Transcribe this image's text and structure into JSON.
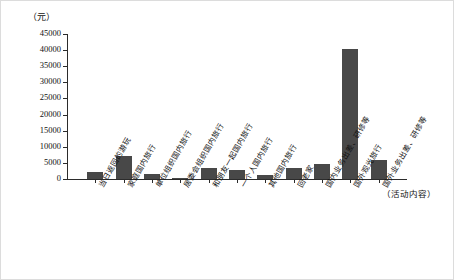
{
  "figure": {
    "background_color": "#ffffff",
    "border_color": "#dcdcdc",
    "bar_color": "#484848",
    "axis_color": "#2b2b2b"
  },
  "axes": {
    "y_unit_caption": "（元）",
    "x_caption": "（活动内容）"
  },
  "chart_data": {
    "type": "bar",
    "title": "",
    "subtitle": "",
    "xlabel": "（活动内容）",
    "ylabel": "（元）",
    "ylim": [
      0,
      45000
    ],
    "ytick_step": 5000,
    "ytick_labels": [
      "0",
      "5000",
      "10000",
      "15000",
      "20000",
      "25000",
      "30000",
      "35000",
      "40000",
      "45000"
    ],
    "ytick_values": [
      0,
      5000,
      10000,
      15000,
      20000,
      25000,
      30000,
      35000,
      40000,
      45000
    ],
    "grid": false,
    "legend": false,
    "legend_position": "none",
    "orientation": "vertical",
    "categories": [
      "当日返回的游玩",
      "家庭国内旅行",
      "单位组织国内旅行",
      "居委会组织国内旅行",
      "和朋友一起国内旅行",
      "一个人国内旅行",
      "其他国内旅行",
      "回老家",
      "国内业务出差、研修等",
      "国外观光旅行",
      "国外业务出差、研修等"
    ],
    "values": [
      2300,
      7000,
      1500,
      300,
      3400,
      2700,
      1300,
      3300,
      4600,
      40500,
      6000
    ]
  }
}
